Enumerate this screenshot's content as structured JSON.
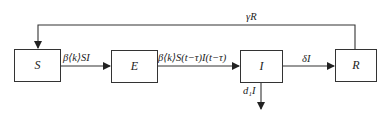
{
  "diagram": {
    "type": "compartment-flow",
    "nodes": [
      {
        "id": "S",
        "label": "S"
      },
      {
        "id": "E",
        "label": "E"
      },
      {
        "id": "I",
        "label": "I"
      },
      {
        "id": "R",
        "label": "R"
      }
    ],
    "edges": [
      {
        "from": "S",
        "to": "E",
        "label": "β⟨k⟩SI"
      },
      {
        "from": "E",
        "to": "I",
        "label": "β⟨k⟩S(t−τ)I(t−τ)"
      },
      {
        "from": "I",
        "to": "R",
        "label": "δI"
      },
      {
        "from": "R",
        "to": "S",
        "label": "γR"
      },
      {
        "from": "I",
        "to": "out",
        "label": "d₁I"
      }
    ]
  }
}
